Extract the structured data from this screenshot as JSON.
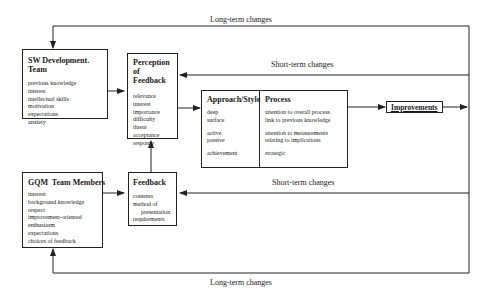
{
  "diagram": {
    "labels": {
      "long_term_top": "Long-term changes",
      "short_term_top": "Short-term changes",
      "short_term_bottom": "Short-term changes",
      "long_term_bottom": "Long-term changes"
    },
    "sw_team": {
      "title": "SW Development. Team",
      "items": [
        "previous knowledge",
        "interest",
        "intellectual skills",
        "motivation",
        "expectations",
        "anxiety"
      ]
    },
    "perception": {
      "title_line1": "Perception of",
      "title_line2": "Feedback",
      "items": [
        "relevance",
        "interest",
        "importance",
        "difficulty",
        "threat",
        "acceptance",
        "response"
      ]
    },
    "approach": {
      "title": "Approach/Style",
      "items": [
        "deep",
        "surface",
        "active",
        "passive",
        "achievement"
      ]
    },
    "process": {
      "title": "Process",
      "items": [
        "attention to overall process",
        "link to previous knowledge",
        "attention to measurements",
        "relating to implications",
        "strategic"
      ]
    },
    "improvements": {
      "title": "Improvements"
    },
    "gqm_team": {
      "title": "GQM  Team Members",
      "items": [
        "interest",
        "background knowledge",
        "respect",
        "improvement-oriented",
        "enthusiasm",
        "expectations",
        "choices of feedback"
      ]
    },
    "feedback": {
      "title": "Feedback",
      "items": [
        "contents",
        "method of",
        "presentation",
        "requirements"
      ]
    }
  }
}
